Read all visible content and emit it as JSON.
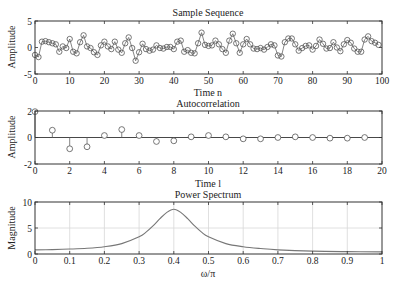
{
  "chart_data": [
    {
      "type": "line",
      "title": "Sample Sequence",
      "xlabel": "Time n",
      "ylabel": "Amplitude",
      "xlim": [
        0,
        100
      ],
      "ylim": [
        -5,
        5
      ],
      "xticks": [
        0,
        10,
        20,
        30,
        40,
        50,
        60,
        70,
        80,
        90,
        100
      ],
      "yticks": [
        -5,
        0,
        5
      ],
      "grid": false,
      "markers": "circle",
      "x": [
        0,
        1,
        2,
        3,
        4,
        5,
        6,
        7,
        8,
        9,
        10,
        11,
        12,
        13,
        14,
        15,
        16,
        17,
        18,
        19,
        20,
        21,
        22,
        23,
        24,
        25,
        26,
        27,
        28,
        29,
        30,
        31,
        32,
        33,
        34,
        35,
        36,
        37,
        38,
        39,
        40,
        41,
        42,
        43,
        44,
        45,
        46,
        47,
        48,
        49,
        50,
        51,
        52,
        53,
        54,
        55,
        56,
        57,
        58,
        59,
        60,
        61,
        62,
        63,
        64,
        65,
        66,
        67,
        68,
        69,
        70,
        71,
        72,
        73,
        74,
        75,
        76,
        77,
        78,
        79,
        80,
        81,
        82,
        83,
        84,
        85,
        86,
        87,
        88,
        89,
        90,
        91,
        92,
        93,
        94,
        95,
        96,
        97,
        98,
        99
      ],
      "values": [
        -1.4,
        -1.8,
        1.1,
        1.2,
        1.0,
        0.8,
        0.6,
        -0.8,
        0.2,
        -0.1,
        1.6,
        -0.8,
        -1.1,
        1.0,
        2.3,
        0.2,
        -0.1,
        -0.9,
        -1.4,
        0.4,
        1.1,
        0.2,
        -0.3,
        1.1,
        -0.4,
        -1.0,
        0.8,
        1.9,
        -0.1,
        -2.5,
        -0.9,
        0.7,
        -0.3,
        -0.6,
        -0.4,
        0.4,
        -0.1,
        -0.2,
        0.1,
        0.1,
        -0.3,
        1.1,
        1.3,
        -0.8,
        -0.5,
        -1.0,
        -1.1,
        0.8,
        2.8,
        0.5,
        0.3,
        0.4,
        1.3,
        0.6,
        -0.3,
        -1.0,
        1.3,
        2.6,
        0.8,
        -1.0,
        0.6,
        1.6,
        0.6,
        -0.2,
        -0.3,
        -0.1,
        -0.4,
        0.1,
        0.6,
        0.4,
        -1.5,
        -1.7,
        1.0,
        1.7,
        1.7,
        0.6,
        -0.6,
        -0.1,
        0.3,
        0.4,
        -0.4,
        0.3,
        1.5,
        0.7,
        -0.2,
        -0.1,
        1.0,
        0.0,
        -0.7,
        0.6,
        1.4,
        0.9,
        -0.2,
        -0.8,
        -0.8,
        1.5,
        2.1,
        1.2,
        0.9,
        0.5,
        -0.3
      ]
    },
    {
      "type": "stem",
      "title": "Autocorrelation",
      "xlabel": "Time l",
      "ylabel": "Amplitude",
      "xlim": [
        0,
        20
      ],
      "ylim": [
        -2,
        2
      ],
      "xticks": [
        0,
        2,
        4,
        6,
        8,
        10,
        12,
        14,
        16,
        18,
        20
      ],
      "yticks": [
        -2,
        0,
        2
      ],
      "grid": false,
      "markers": "circle",
      "x": [
        0,
        1,
        2,
        3,
        4,
        5,
        6,
        7,
        8,
        9,
        10,
        11,
        12,
        13,
        14,
        15,
        16,
        17,
        18,
        19
      ],
      "values": [
        1.95,
        0.55,
        -0.85,
        -0.7,
        0.15,
        0.6,
        0.15,
        -0.3,
        -0.25,
        0.05,
        0.15,
        0.05,
        -0.1,
        -0.1,
        0.0,
        0.05,
        0.0,
        -0.05,
        -0.05,
        0.0
      ]
    },
    {
      "type": "line",
      "title": "Power Spectrum",
      "xlabel": "ω/π",
      "ylabel": "Magnitude",
      "xlim": [
        0,
        1
      ],
      "ylim": [
        0,
        10
      ],
      "xticks": [
        0,
        0.1,
        0.2,
        0.3,
        0.4,
        0.5,
        0.6,
        0.7,
        0.8,
        0.9,
        1
      ],
      "yticks": [
        0,
        5,
        10
      ],
      "grid": true,
      "x": [
        0,
        0.05,
        0.1,
        0.15,
        0.2,
        0.25,
        0.3,
        0.32,
        0.34,
        0.36,
        0.38,
        0.4,
        0.42,
        0.44,
        0.46,
        0.48,
        0.5,
        0.55,
        0.6,
        0.65,
        0.7,
        0.8,
        0.9,
        1.0
      ],
      "values": [
        0.8,
        0.85,
        0.95,
        1.1,
        1.4,
        2.0,
        3.3,
        4.2,
        5.4,
        6.8,
        8.0,
        8.6,
        8.0,
        6.8,
        5.4,
        4.2,
        3.3,
        2.0,
        1.4,
        1.05,
        0.8,
        0.55,
        0.45,
        0.4
      ]
    }
  ],
  "labels": {
    "p1_title": "Sample Sequence",
    "p1_xlabel": "Time n",
    "p1_ylabel": "Amplitude",
    "p2_title": "Autocorrelation",
    "p2_xlabel": "Time l",
    "p2_ylabel": "Amplitude",
    "p3_title": "Power Spectrum",
    "p3_xlabel": "ω/π",
    "p3_ylabel": "Magnitude"
  },
  "colors": {
    "axis": "#333333",
    "marker": "#555555",
    "line": "#666666",
    "spectrum": "#777777",
    "grid": "#d8d8d8"
  }
}
